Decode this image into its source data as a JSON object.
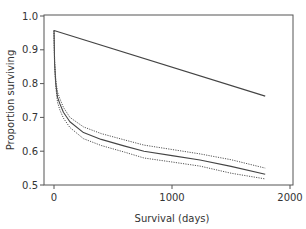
{
  "chart_data": {
    "type": "line",
    "title": "",
    "xlabel": "Survival (days)",
    "ylabel": "Proportion surviving",
    "xlim": [
      -90,
      2080
    ],
    "ylim": [
      0.5,
      1.0
    ],
    "xticks": [
      0,
      1000,
      2000
    ],
    "xtick_labels": [
      "0",
      "1000",
      "2000"
    ],
    "yticks": [
      0.5,
      0.6,
      0.7,
      0.8,
      0.9,
      1.0
    ],
    "ytick_labels": [
      "0.5",
      "0.6",
      "0.7",
      "0.8",
      "0.9",
      "1.0"
    ],
    "grid": false,
    "legend": null,
    "series": [
      {
        "name": "Reference (upper line)",
        "style": "solid",
        "x": [
          0,
          1790
        ],
        "values": [
          0.957,
          0.763
        ]
      },
      {
        "name": "Survival estimate",
        "style": "solid",
        "x": [
          0,
          5,
          15,
          30,
          50,
          80,
          135,
          250,
          400,
          600,
          763,
          1000,
          1237,
          1500,
          1790
        ],
        "values": [
          0.957,
          0.86,
          0.8,
          0.76,
          0.74,
          0.715,
          0.687,
          0.655,
          0.635,
          0.615,
          0.6,
          0.587,
          0.574,
          0.555,
          0.532
        ]
      },
      {
        "name": "Upper confidence limit",
        "style": "dotted",
        "x": [
          0,
          5,
          15,
          30,
          50,
          80,
          135,
          250,
          400,
          600,
          763,
          1000,
          1237,
          1500,
          1790
        ],
        "values": [
          0.957,
          0.87,
          0.81,
          0.775,
          0.755,
          0.73,
          0.7,
          0.672,
          0.652,
          0.633,
          0.618,
          0.605,
          0.592,
          0.575,
          0.55
        ]
      },
      {
        "name": "Lower confidence limit",
        "style": "dotted",
        "x": [
          0,
          5,
          15,
          30,
          50,
          80,
          135,
          250,
          400,
          600,
          763,
          1000,
          1237,
          1500,
          1790
        ],
        "values": [
          0.957,
          0.85,
          0.79,
          0.745,
          0.722,
          0.698,
          0.67,
          0.637,
          0.617,
          0.597,
          0.58,
          0.568,
          0.556,
          0.535,
          0.518
        ]
      }
    ]
  }
}
